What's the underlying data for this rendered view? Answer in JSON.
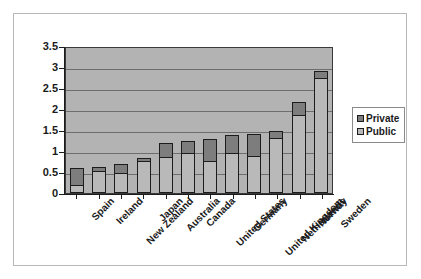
{
  "chart_data": {
    "type": "bar",
    "subtype": "stacked-bar",
    "title": "",
    "xlabel": "",
    "ylabel": "",
    "ylim": [
      0,
      3.5
    ],
    "ytick_labels": [
      "3.5",
      "3",
      "2.5",
      "2",
      "1.5",
      "1",
      "0.5",
      "0"
    ],
    "ytick_values": [
      3.5,
      3,
      2.5,
      2,
      1.5,
      1,
      0.5,
      0
    ],
    "grid": true,
    "grid_axis": "y",
    "legend_position": "right",
    "categories": [
      "Spain",
      "Ireland",
      "New Zealand",
      "Japan",
      "Australia",
      "Canada",
      "United States",
      "Germany",
      "United Kingdom",
      "Netherlands",
      "Norway",
      "Sweden"
    ],
    "series": [
      {
        "name": "Public",
        "color": "#b9b9b9",
        "values": [
          0.17,
          0.55,
          0.48,
          0.78,
          0.86,
          0.97,
          0.76,
          0.96,
          0.9,
          1.33,
          1.88,
          2.75
        ]
      },
      {
        "name": "Private",
        "color": "#7d7d7d",
        "values": [
          0.43,
          0.08,
          0.22,
          0.05,
          0.32,
          0.28,
          0.53,
          0.41,
          0.5,
          0.14,
          0.28,
          0.16
        ]
      }
    ],
    "totals": [
      0.6,
      0.63,
      0.7,
      0.83,
      1.18,
      1.25,
      1.29,
      1.37,
      1.4,
      1.47,
      2.16,
      2.91
    ]
  },
  "legend": {
    "items": [
      {
        "label": "Private",
        "color": "#7d7d7d"
      },
      {
        "label": "Public",
        "color": "#b9b9b9"
      }
    ]
  }
}
